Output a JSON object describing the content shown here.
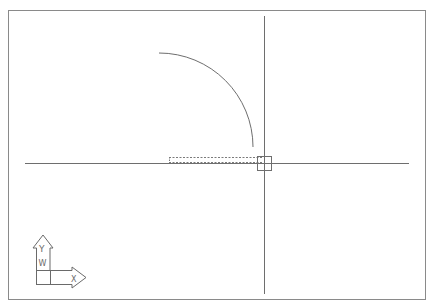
{
  "app": {
    "type": "cad-drawing-viewport",
    "background_color": "#ffffff",
    "line_color": "#6e6e6e",
    "border_color": "#8a8a8a"
  },
  "drawing": {
    "entities": [
      {
        "kind": "arc",
        "name": "quarter-arc"
      },
      {
        "kind": "dashed-rectangle",
        "name": "selection-preview-rectangle"
      }
    ]
  },
  "cursor": {
    "type": "crosshair",
    "pickbox": true
  },
  "ucs_icon": {
    "x_label": "X",
    "y_label": "Y",
    "w_label": "W"
  }
}
